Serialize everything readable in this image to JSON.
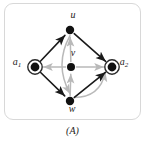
{
  "figure": {
    "caption": "(A)",
    "panel_border_color": "#d8d8d8",
    "background_color": "#ffffff"
  },
  "chart_data": {
    "type": "diagram",
    "title": "(A)",
    "subtype": "directed-graph",
    "colors": {
      "black_edge": "#1a1a1a",
      "gray_edge": "#b9b9b9",
      "node_fill": "#111111",
      "ring_stroke": "#2a2a2a"
    },
    "nodes": [
      {
        "id": "u",
        "label": "u",
        "sub": "",
        "x": 70,
        "y": 30,
        "marker": "filled-disc",
        "r": 4.2,
        "label_dx": 0,
        "label_dy": -16
      },
      {
        "id": "a1",
        "label": "a",
        "sub": "1",
        "x": 35,
        "y": 67,
        "marker": "filled-disc-ring",
        "r": 4.4,
        "label_dx": -21,
        "label_dy": -6
      },
      {
        "id": "v",
        "label": "v",
        "sub": "",
        "x": 71,
        "y": 67,
        "marker": "filled-disc",
        "r": 4.0,
        "label_dx": -1,
        "label_dy": -15
      },
      {
        "id": "a2",
        "label": "a",
        "sub": "2",
        "x": 112,
        "y": 67,
        "marker": "filled-disc-ring",
        "r": 4.4,
        "label_dx": 9,
        "label_dy": -6
      },
      {
        "id": "w",
        "label": "w",
        "sub": "",
        "x": 70,
        "y": 101,
        "marker": "filled-disc",
        "r": 4.2,
        "label_dx": -1,
        "label_dy": 7
      }
    ],
    "edges": [
      {
        "from": "a1",
        "to": "u",
        "color": "black",
        "style": "straight",
        "arrow": "end"
      },
      {
        "from": "u",
        "to": "a2",
        "color": "black",
        "style": "straight",
        "arrow": "end"
      },
      {
        "from": "a1",
        "to": "w",
        "color": "black",
        "style": "straight",
        "arrow": "end"
      },
      {
        "from": "w",
        "to": "a2",
        "color": "black",
        "style": "straight",
        "arrow": "end"
      },
      {
        "from": "v",
        "to": "a1",
        "color": "gray",
        "style": "straight",
        "arrow": "end"
      },
      {
        "from": "v",
        "to": "a2",
        "color": "gray",
        "style": "straight",
        "arrow": "end"
      },
      {
        "from": "v",
        "to": "u",
        "color": "gray",
        "style": "straight",
        "arrow": "end"
      },
      {
        "from": "w",
        "to": "v",
        "color": "gray",
        "style": "straight",
        "arrow": "end"
      },
      {
        "from": "u",
        "to": "w",
        "color": "gray",
        "style": "curved-right",
        "arrow": "end"
      },
      {
        "from": "w",
        "to": "a2",
        "color": "gray",
        "style": "curved-right",
        "arrow": "end"
      }
    ],
    "legend": [],
    "grid": false
  }
}
